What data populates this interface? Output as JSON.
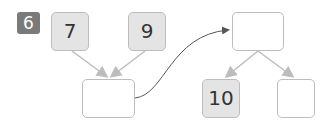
{
  "question_number": "6",
  "boxes": {
    "top_left": "7",
    "top_middle": "9",
    "sum_box": "",
    "right_top": "",
    "right_bottom_left": "10",
    "right_bottom_right": ""
  },
  "colors": {
    "badge": "#7a7a7a",
    "filled_box": "#e4e4e4",
    "border": "#bdbdbd",
    "arrow": "#bdbdbd",
    "curve": "#555555"
  }
}
